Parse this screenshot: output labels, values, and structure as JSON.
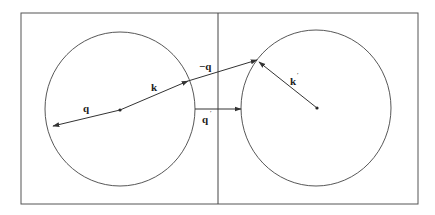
{
  "diagram": {
    "type": "vector-scattering-diagram",
    "panels": [
      {
        "name": "left",
        "sphere": "circle centered at origin",
        "center_dot": true
      },
      {
        "name": "right",
        "sphere": "circle centered at origin",
        "center_dot": true
      }
    ],
    "vectors": [
      {
        "id": "q",
        "label": "q",
        "prime": "",
        "from": "left-center",
        "direction": "left-down"
      },
      {
        "id": "k",
        "label": "k",
        "prime": "",
        "from": "left-center",
        "direction": "right-up to sphere surface"
      },
      {
        "id": "minus_q",
        "label": "−q",
        "prime": "",
        "from": "tip of k",
        "direction": "right-up to right sphere surface"
      },
      {
        "id": "q_prime",
        "label": "q",
        "prime": "′",
        "from": "left sphere edge",
        "direction": "horizontal right to right sphere edge"
      },
      {
        "id": "k_prime",
        "label": "k",
        "prime": "′",
        "from": "right-center",
        "direction": "left-up to sphere surface"
      }
    ],
    "colors": {
      "line": "#333333",
      "background": "#ffffff"
    }
  }
}
